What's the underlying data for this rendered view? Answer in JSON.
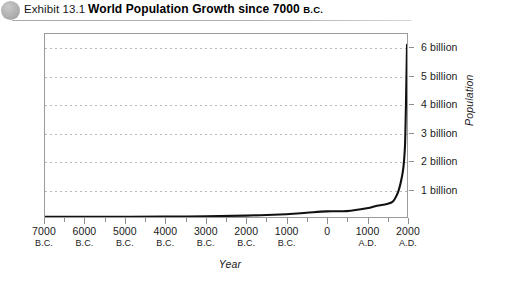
{
  "header": {
    "bullet_icon": "exhibit-bullet-circle",
    "exhibit_label": "Exhibit 13.1",
    "title_main": "World Population Growth since 7000 ",
    "title_era": "B.C."
  },
  "chart_data": {
    "type": "line",
    "title": "World Population Growth since 7000 B.C.",
    "xlabel": "Year",
    "ylabel": "Population",
    "grid": true,
    "legend": null,
    "xlim": [
      -7000,
      2000
    ],
    "ylim": [
      0,
      6.5
    ],
    "x_tick_labels": [
      {
        "value": -7000,
        "year": "7000",
        "era": "B.C."
      },
      {
        "value": -6000,
        "year": "6000",
        "era": "B.C."
      },
      {
        "value": -5000,
        "year": "5000",
        "era": "B.C."
      },
      {
        "value": -4000,
        "year": "4000",
        "era": "B.C."
      },
      {
        "value": -3000,
        "year": "3000",
        "era": "B.C."
      },
      {
        "value": -2000,
        "year": "2000",
        "era": "B.C."
      },
      {
        "value": -1000,
        "year": "1000",
        "era": "B.C."
      },
      {
        "value": 0,
        "year": "0",
        "era": ""
      },
      {
        "value": 1000,
        "year": "1000",
        "era": "A.D."
      },
      {
        "value": 2000,
        "year": "2000",
        "era": "A.D."
      }
    ],
    "x_minor_ticks": [
      -6500,
      -5500,
      -4500,
      -3500,
      -2500,
      -1500,
      -500,
      500,
      1500
    ],
    "y_tick_labels": [
      {
        "value": 1,
        "label": "1 billion"
      },
      {
        "value": 2,
        "label": "2 billion"
      },
      {
        "value": 3,
        "label": "3 billion"
      },
      {
        "value": 4,
        "label": "4 billion"
      },
      {
        "value": 5,
        "label": "5 billion"
      },
      {
        "value": 6,
        "label": "6 billion"
      }
    ],
    "series": [
      {
        "name": "World population",
        "units": "billions",
        "x": [
          -7000,
          -6000,
          -5000,
          -4000,
          -3000,
          -2000,
          -1000,
          -500,
          0,
          500,
          1000,
          1250,
          1500,
          1650,
          1750,
          1800,
          1850,
          1900,
          1927,
          1950,
          1960,
          1974,
          1987,
          1999,
          2000
        ],
        "values": [
          0.005,
          0.007,
          0.01,
          0.015,
          0.025,
          0.05,
          0.1,
          0.15,
          0.2,
          0.21,
          0.31,
          0.4,
          0.46,
          0.55,
          0.79,
          0.98,
          1.26,
          1.65,
          2.0,
          2.52,
          3.02,
          4.0,
          5.0,
          6.0,
          6.1
        ]
      }
    ]
  },
  "colors": {
    "curve": "#111111",
    "grid": "#b9b9b9",
    "frame": "#9b9b9b",
    "bullet": "#b0b0b0",
    "rule": "#a8a8a8"
  }
}
